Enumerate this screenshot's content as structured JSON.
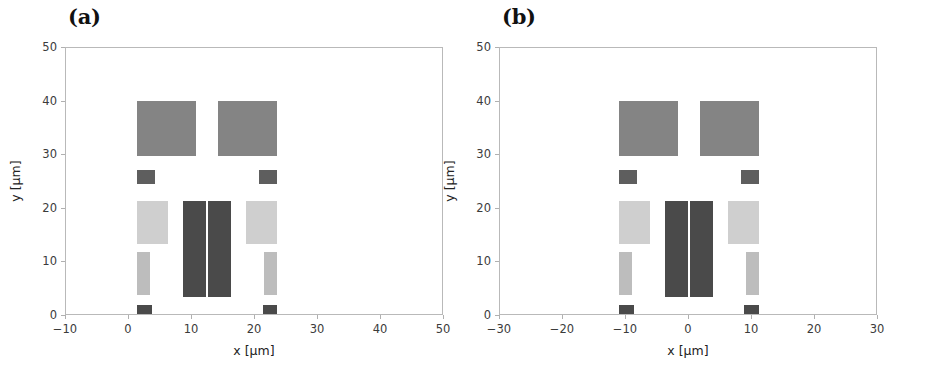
{
  "figure": {
    "background": "#ffffff",
    "panel_count": 2
  },
  "palette": {
    "medium_gray": "#848484",
    "dark_gray": "#5e5e5e",
    "light_gray": "#cfcfcf",
    "mid_light_gray": "#bdbdbd",
    "darkest_gray": "#4a4a4a",
    "axis_line": "#b9b9b9",
    "tick_label": "#3b3b3b",
    "axis_title": "#222222"
  },
  "chart_data": [
    {
      "type": "patch_map",
      "panel_label": "(a)",
      "title": "",
      "xlabel": "x [µm]",
      "ylabel": "y [µm]",
      "xlim": [
        -10,
        50
      ],
      "ylim": [
        0,
        50
      ],
      "xticks": [
        -10,
        0,
        10,
        20,
        30,
        40,
        50
      ],
      "xticklabels": [
        "−10",
        "0",
        "10",
        "20",
        "30",
        "40",
        "50"
      ],
      "yticks": [
        0,
        10,
        20,
        30,
        40,
        50
      ],
      "yticklabels": [
        "0",
        "10",
        "20",
        "30",
        "40",
        "50"
      ],
      "grid": false,
      "legend": "none",
      "shapes": [
        {
          "name": "top-pad-left",
          "x": 1.3,
          "y": 29.8,
          "w": 9.3,
          "h": 10.4,
          "color": "#848484"
        },
        {
          "name": "top-pad-right",
          "x": 14.2,
          "y": 29.8,
          "w": 9.3,
          "h": 10.4,
          "color": "#848484"
        },
        {
          "name": "contact-square-left",
          "x": 1.3,
          "y": 24.6,
          "w": 2.9,
          "h": 2.6,
          "color": "#5e5e5e"
        },
        {
          "name": "contact-square-right",
          "x": 20.6,
          "y": 24.6,
          "w": 2.9,
          "h": 2.6,
          "color": "#5e5e5e"
        },
        {
          "name": "side-pad-left",
          "x": 1.3,
          "y": 13.5,
          "w": 4.9,
          "h": 8.0,
          "color": "#cfcfcf"
        },
        {
          "name": "side-pad-right",
          "x": 18.6,
          "y": 13.5,
          "w": 4.9,
          "h": 8.0,
          "color": "#cfcfcf"
        },
        {
          "name": "center-bar-left",
          "x": 8.6,
          "y": 3.5,
          "w": 3.6,
          "h": 18.0,
          "color": "#4a4a4a"
        },
        {
          "name": "center-bar-right",
          "x": 12.6,
          "y": 3.5,
          "w": 3.6,
          "h": 18.0,
          "color": "#4a4a4a"
        },
        {
          "name": "strip-left",
          "x": 1.3,
          "y": 3.9,
          "w": 2.0,
          "h": 8.1,
          "color": "#bdbdbd"
        },
        {
          "name": "strip-right",
          "x": 21.5,
          "y": 3.9,
          "w": 2.0,
          "h": 8.1,
          "color": "#bdbdbd"
        },
        {
          "name": "bottom-square-left",
          "x": 1.3,
          "y": 0.0,
          "w": 2.3,
          "h": 2.1,
          "color": "#4a4a4a"
        },
        {
          "name": "bottom-square-right",
          "x": 21.2,
          "y": 0.0,
          "w": 2.3,
          "h": 2.1,
          "color": "#4a4a4a"
        }
      ]
    },
    {
      "type": "patch_map",
      "panel_label": "(b)",
      "title": "",
      "xlabel": "x [µm]",
      "ylabel": "y [µm]",
      "xlim": [
        -30,
        30
      ],
      "ylim": [
        0,
        50
      ],
      "xticks": [
        -30,
        -20,
        -10,
        0,
        10,
        20,
        30
      ],
      "xticklabels": [
        "−30",
        "−20",
        "−10",
        "0",
        "10",
        "20",
        "30"
      ],
      "yticks": [
        0,
        10,
        20,
        30,
        40,
        50
      ],
      "yticklabels": [
        "0",
        "10",
        "20",
        "30",
        "40",
        "50"
      ],
      "grid": false,
      "legend": "none",
      "shapes": [
        {
          "name": "top-pad-left",
          "x": -11.1,
          "y": 29.8,
          "w": 9.3,
          "h": 10.4,
          "color": "#848484"
        },
        {
          "name": "top-pad-right",
          "x": 1.8,
          "y": 29.8,
          "w": 9.3,
          "h": 10.4,
          "color": "#848484"
        },
        {
          "name": "contact-square-left",
          "x": -11.1,
          "y": 24.6,
          "w": 2.9,
          "h": 2.6,
          "color": "#5e5e5e"
        },
        {
          "name": "contact-square-right",
          "x": 8.2,
          "y": 24.6,
          "w": 2.9,
          "h": 2.6,
          "color": "#5e5e5e"
        },
        {
          "name": "side-pad-left",
          "x": -11.1,
          "y": 13.5,
          "w": 4.9,
          "h": 8.0,
          "color": "#cfcfcf"
        },
        {
          "name": "side-pad-right",
          "x": 6.2,
          "y": 13.5,
          "w": 4.9,
          "h": 8.0,
          "color": "#cfcfcf"
        },
        {
          "name": "center-bar-left",
          "x": -3.8,
          "y": 3.5,
          "w": 3.6,
          "h": 18.0,
          "color": "#4a4a4a"
        },
        {
          "name": "center-bar-right",
          "x": 0.2,
          "y": 3.5,
          "w": 3.6,
          "h": 18.0,
          "color": "#4a4a4a"
        },
        {
          "name": "strip-left",
          "x": -11.1,
          "y": 3.9,
          "w": 2.0,
          "h": 8.1,
          "color": "#bdbdbd"
        },
        {
          "name": "strip-right",
          "x": 9.1,
          "y": 3.9,
          "w": 2.0,
          "h": 8.1,
          "color": "#bdbdbd"
        },
        {
          "name": "bottom-square-left",
          "x": -11.1,
          "y": 0.0,
          "w": 2.3,
          "h": 2.1,
          "color": "#4a4a4a"
        },
        {
          "name": "bottom-square-right",
          "x": 8.8,
          "y": 0.0,
          "w": 2.3,
          "h": 2.1,
          "color": "#4a4a4a"
        }
      ]
    }
  ]
}
